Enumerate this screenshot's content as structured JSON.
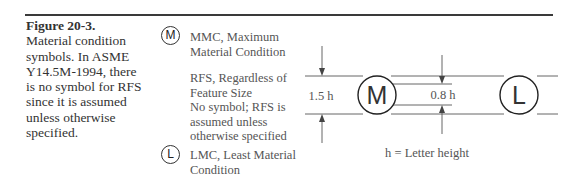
{
  "caption": {
    "figure_label": "Figure 20-3.",
    "text": "Material condition symbols. In ASME Y14.5M-1994, there is no symbol for RFS since it is assumed unless otherwise specified."
  },
  "symbols": [
    {
      "glyph": "M",
      "lines": [
        "MMC, Maximum",
        "Material Condition"
      ]
    },
    {
      "glyph": "",
      "lines": [
        "RFS, Regardless of",
        "Feature Size",
        "No symbol; RFS is",
        "assumed unless",
        "otherwise specified"
      ]
    },
    {
      "glyph": "L",
      "lines": [
        "LMC, Least Material",
        "Condition"
      ]
    }
  ],
  "diagram": {
    "outer_dim": "1.5 h",
    "inner_dim": "0.8 h",
    "glyph_m": "M",
    "glyph_l": "L",
    "legend": "h = Letter height"
  }
}
